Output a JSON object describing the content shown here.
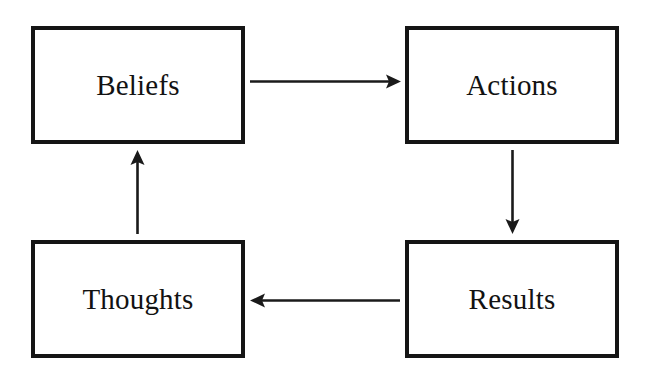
{
  "diagram": {
    "type": "cycle-flowchart",
    "background_color": "#ffffff",
    "stroke_color": "#151515",
    "text_color": "#121212",
    "nodes": [
      {
        "id": "beliefs",
        "label": "Beliefs",
        "position": "top-left"
      },
      {
        "id": "actions",
        "label": "Actions",
        "position": "top-right"
      },
      {
        "id": "results",
        "label": "Results",
        "position": "bottom-right"
      },
      {
        "id": "thoughts",
        "label": "Thoughts",
        "position": "bottom-left"
      }
    ],
    "edges": [
      {
        "id": "beliefs-to-actions",
        "from": "beliefs",
        "to": "actions",
        "direction": "right",
        "label": ""
      },
      {
        "id": "actions-to-results",
        "from": "actions",
        "to": "results",
        "direction": "down",
        "label": ""
      },
      {
        "id": "results-to-thoughts",
        "from": "results",
        "to": "thoughts",
        "direction": "left",
        "label": ""
      },
      {
        "id": "thoughts-to-beliefs",
        "from": "thoughts",
        "to": "beliefs",
        "direction": "up",
        "label": ""
      }
    ]
  }
}
